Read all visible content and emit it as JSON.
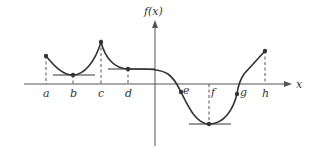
{
  "diagram": {
    "title": "",
    "y_axis_label": "f(x)",
    "x_axis_label": "x",
    "points": [
      {
        "label": "a",
        "x": 46,
        "y": 56,
        "dashed": true,
        "tangent": null
      },
      {
        "label": "b",
        "x": 73,
        "y": 75,
        "dashed": true,
        "tangent": [
          53,
          95
        ]
      },
      {
        "label": "c",
        "x": 101,
        "y": 42,
        "dashed": true,
        "tangent": null
      },
      {
        "label": "d",
        "x": 128,
        "y": 69,
        "dashed": true,
        "tangent": [
          108,
          155
        ]
      },
      {
        "label": "e",
        "x": 181,
        "y": 92,
        "dashed": false,
        "tangent": null
      },
      {
        "label": "f",
        "x": 209,
        "y": 124,
        "dashed": true,
        "tangent": [
          189,
          231
        ]
      },
      {
        "label": "g",
        "x": 237,
        "y": 94,
        "dashed": false,
        "tangent": null
      },
      {
        "label": "h",
        "x": 265,
        "y": 51,
        "dashed": true,
        "tangent": null
      }
    ],
    "colors": {
      "curve": "#333333",
      "axis": "#555555",
      "background": "#ffffff"
    }
  }
}
